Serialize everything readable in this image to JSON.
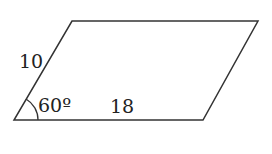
{
  "figure": {
    "shape": "parallelogram",
    "vertices": {
      "bottom_left": [
        14,
        120
      ],
      "bottom_right": [
        203,
        120
      ],
      "top_right": [
        258,
        21
      ],
      "top_left": [
        72,
        21
      ]
    },
    "side_left_label": "10",
    "side_bottom_label": "18",
    "angle_label": "60º",
    "stroke_color": "#333333",
    "background_color": "#ffffff"
  }
}
